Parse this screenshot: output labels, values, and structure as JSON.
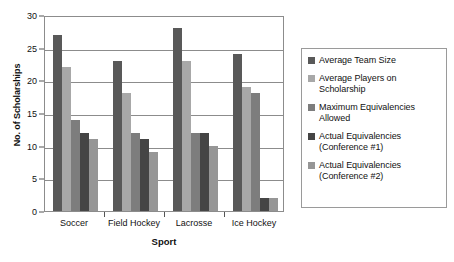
{
  "chart_data": {
    "type": "bar",
    "title": "",
    "xlabel": "Sport",
    "ylabel": "No. of Scholarships",
    "ylim": [
      0,
      30
    ],
    "ytick_values": [
      0,
      5,
      10,
      15,
      20,
      25,
      30
    ],
    "ytick_labels": [
      "0",
      "5",
      "10",
      "15",
      "20",
      "25",
      "30"
    ],
    "grid": true,
    "legend_position": "right",
    "categories": [
      "Soccer",
      "Field Hockey",
      "Lacrosse",
      "Ice Hockey"
    ],
    "series": [
      {
        "name": "Average Team Size",
        "color": "#595959",
        "values": [
          27,
          23,
          28,
          24
        ]
      },
      {
        "name": "Average Players on Scholarship",
        "color": "#a8a8a8",
        "values": [
          22,
          18,
          23,
          19
        ]
      },
      {
        "name": "Maximum Equivalencies Allowed",
        "color": "#7d7d7d",
        "values": [
          14,
          12,
          12,
          18
        ]
      },
      {
        "name": "Actual Equivalencies (Conference #1)",
        "color": "#454545",
        "values": [
          12,
          11,
          12,
          2
        ]
      },
      {
        "name": "Actual Equivalencies (Conference #2)",
        "color": "#969696",
        "values": [
          11,
          9,
          10,
          2
        ]
      }
    ]
  },
  "legend": {
    "entries": [
      {
        "label": "Average Team Size",
        "color": "#595959"
      },
      {
        "label": "Average Players on Scholarship",
        "color": "#a8a8a8"
      },
      {
        "label": "Maximum Equivalencies Allowed",
        "color": "#7d7d7d"
      },
      {
        "label": "Actual Equivalencies (Conference #1)",
        "color": "#454545"
      },
      {
        "label": "Actual Equivalencies (Conference #2)",
        "color": "#969696"
      }
    ]
  },
  "axes": {
    "y_title": "No. of Scholarships",
    "x_title": "Sport"
  }
}
